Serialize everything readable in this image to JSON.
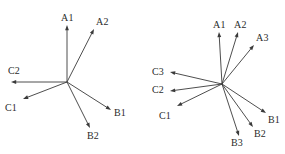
{
  "figure": {
    "background_color": "#ffffff",
    "stroke_color": "#3a3a3a",
    "label_color": "#2b2b2b",
    "width": 285,
    "height": 154
  },
  "chart_data": {
    "type": "scatter",
    "title": "",
    "subtitle": "",
    "xlabel": "",
    "ylabel": "",
    "grid": false,
    "legend": "none",
    "panels": [
      {
        "name": "left-panel",
        "origin": {
          "x": 67,
          "y": 82
        },
        "vector_count": 6,
        "vectors": [
          {
            "label": "A1",
            "tip_x": 67,
            "tip_y": 25,
            "angle_deg": 90.0,
            "length": 57,
            "label_x": 61,
            "label_y": 12
          },
          {
            "label": "A2",
            "tip_x": 94,
            "tip_y": 29,
            "angle_deg": 61.0,
            "length": 60.6,
            "label_x": 96,
            "label_y": 16
          },
          {
            "label": "C2",
            "tip_x": 11,
            "tip_y": 82,
            "angle_deg": 180.0,
            "length": 56,
            "label_x": 8,
            "label_y": 65
          },
          {
            "label": "C1",
            "tip_x": 23,
            "tip_y": 99,
            "angle_deg": 201.1,
            "length": 47.1,
            "label_x": 5,
            "label_y": 102
          },
          {
            "label": "B1",
            "tip_x": 111,
            "tip_y": 110,
            "angle_deg": 327.5,
            "length": 52.2,
            "label_x": 114,
            "label_y": 107
          },
          {
            "label": "B2",
            "tip_x": 90,
            "tip_y": 128,
            "angle_deg": 296.5,
            "length": 51.4,
            "label_x": 87,
            "label_y": 130
          }
        ]
      },
      {
        "name": "right-panel",
        "origin": {
          "x": 222,
          "y": 84
        },
        "vector_count": 7,
        "vectors": [
          {
            "label": "A1",
            "tip_x": 219,
            "tip_y": 32,
            "angle_deg": 93.3,
            "length": 52.1,
            "label_x": 213,
            "label_y": 19
          },
          {
            "label": "A2",
            "tip_x": 238,
            "tip_y": 32,
            "angle_deg": 72.9,
            "length": 54.4,
            "label_x": 234,
            "label_y": 19
          },
          {
            "label": "A3",
            "tip_x": 254,
            "tip_y": 45,
            "angle_deg": 52.3,
            "length": 49.4,
            "label_x": 256,
            "label_y": 32
          },
          {
            "label": "C3",
            "tip_x": 170,
            "tip_y": 72,
            "angle_deg": 167.0,
            "length": 53.4,
            "label_x": 152,
            "label_y": 66
          },
          {
            "label": "C2",
            "tip_x": 170,
            "tip_y": 91,
            "angle_deg": 187.7,
            "length": 52.5,
            "label_x": 152,
            "label_y": 84
          },
          {
            "label": "C1",
            "tip_x": 177,
            "tip_y": 106,
            "angle_deg": 204.1,
            "length": 49.3,
            "label_x": 159,
            "label_y": 110
          },
          {
            "label": "B1",
            "tip_x": 266,
            "tip_y": 113,
            "angle_deg": 326.6,
            "length": 52.7,
            "label_x": 268,
            "label_y": 114
          },
          {
            "label": "B2",
            "tip_x": 253,
            "tip_y": 127,
            "angle_deg": 305.8,
            "length": 53.2,
            "label_x": 254,
            "label_y": 128
          },
          {
            "label": "B3",
            "tip_x": 239,
            "tip_y": 136,
            "angle_deg": 287.6,
            "length": 54.6,
            "label_x": 231,
            "label_y": 137
          }
        ]
      }
    ]
  }
}
